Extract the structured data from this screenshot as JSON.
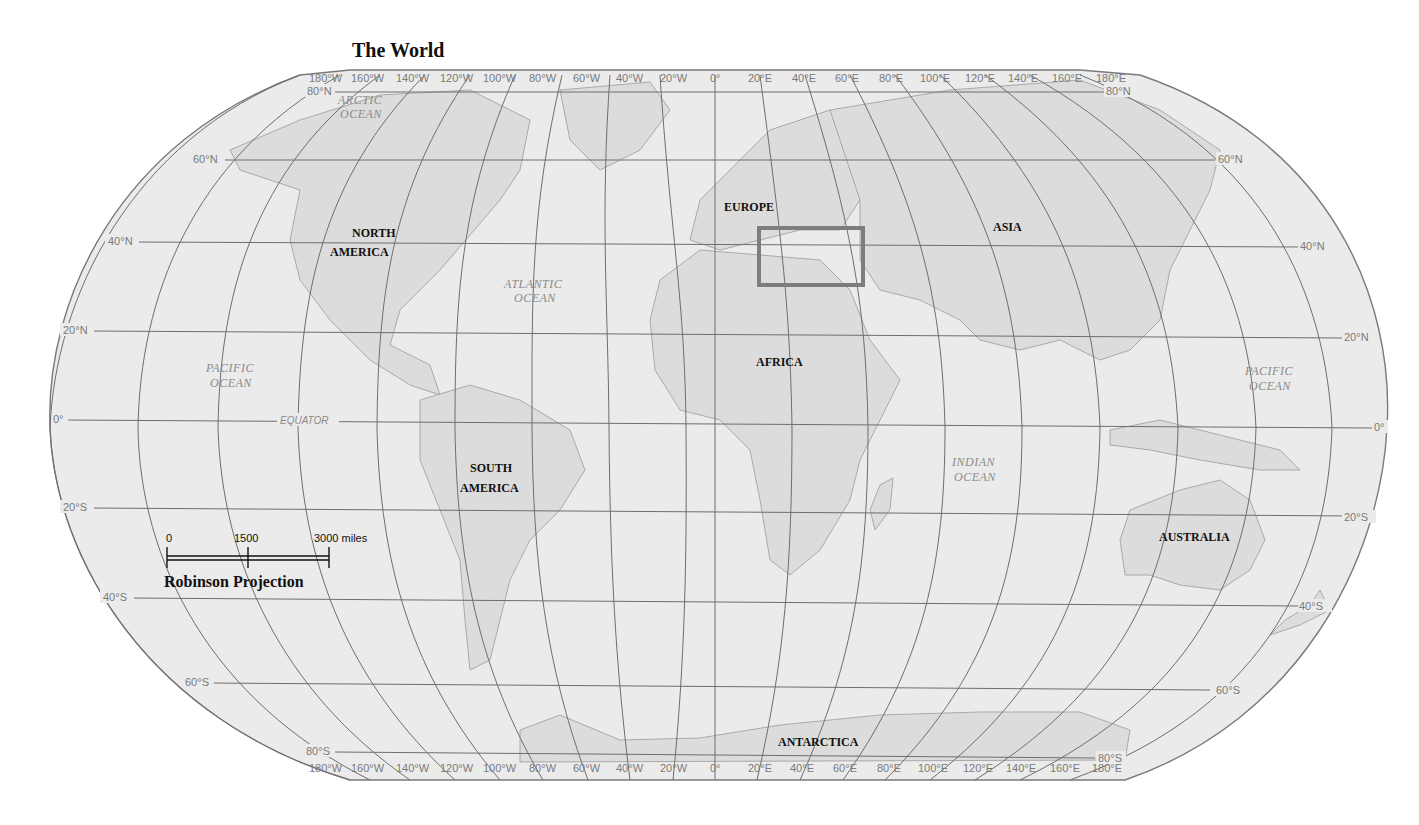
{
  "map": {
    "title": "The World",
    "projection": "Robinson Projection",
    "scale": {
      "labels": [
        "0",
        "1500",
        "3000 miles"
      ]
    },
    "longitude_labels": [
      "180°W",
      "160°W",
      "140°W",
      "120°W",
      "100°W",
      "80°W",
      "60°W",
      "40°W",
      "20°W",
      "0°",
      "20°E",
      "40°E",
      "60°E",
      "80°E",
      "100°E",
      "120°E",
      "140°E",
      "160°E",
      "180°E"
    ],
    "latitude_labels": {
      "n80": "80°N",
      "n60": "60°N",
      "n40": "40°N",
      "n20": "20°N",
      "eq": "0°",
      "s20": "20°S",
      "s40": "40°S",
      "s60": "60°S",
      "s80": "80°S"
    },
    "continents": {
      "north_america": [
        "NORTH",
        "AMERICA"
      ],
      "south_america": [
        "SOUTH",
        "AMERICA"
      ],
      "europe": "EUROPE",
      "africa": "AFRICA",
      "asia": "ASIA",
      "australia": "AUSTRALIA",
      "antarctica": "ANTARCTICA"
    },
    "oceans": {
      "arctic": [
        "ARCTIC",
        "OCEAN"
      ],
      "atlantic": [
        "ATLANTIC",
        "OCEAN"
      ],
      "pacific_west": [
        "PACIFIC",
        "OCEAN"
      ],
      "pacific_east": [
        "PACIFIC",
        "OCEAN"
      ],
      "indian": [
        "INDIAN",
        "OCEAN"
      ]
    },
    "equator_label": "EQUATOR",
    "highlight_region": "Mediterranean / Middle East box"
  }
}
